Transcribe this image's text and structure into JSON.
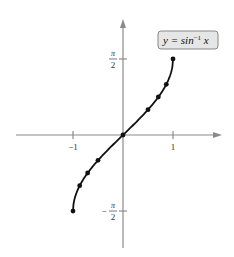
{
  "chart_data": {
    "type": "line",
    "title": "",
    "legend": {
      "text_main": "y = sin",
      "text_sup": "−1",
      "text_var": " x",
      "placement": "top-right"
    },
    "xlabel": "",
    "ylabel": "",
    "xlim": [
      -1.55,
      1.45
    ],
    "ylim": [
      -1.95,
      1.75
    ],
    "x_ticks": [
      {
        "value": -1,
        "label": "−1"
      },
      {
        "value": 1,
        "label": "1"
      }
    ],
    "y_ticks": [
      {
        "value": 1.5708,
        "num": "π",
        "den": "2",
        "sign": ""
      },
      {
        "value": -1.5708,
        "num": "π",
        "den": "2",
        "sign": "−"
      }
    ],
    "series": [
      {
        "name": "y = sin^-1 x",
        "function": "asin",
        "domain": [
          -1,
          1
        ],
        "points": [
          {
            "x": -1,
            "y": -1.5708
          },
          {
            "x": -0.866,
            "y": -1.0472
          },
          {
            "x": -0.7071,
            "y": -0.7854
          },
          {
            "x": -0.5,
            "y": -0.5236
          },
          {
            "x": 0,
            "y": 0
          },
          {
            "x": 0.5,
            "y": 0.5236
          },
          {
            "x": 0.7071,
            "y": 0.7854
          },
          {
            "x": 0.866,
            "y": 1.0472
          },
          {
            "x": 1,
            "y": 1.5708
          }
        ]
      }
    ],
    "grid": false,
    "colors": {
      "curve": "#111111",
      "axes": "#8a8a8a",
      "legend_bg": "#e6e6e6"
    }
  }
}
